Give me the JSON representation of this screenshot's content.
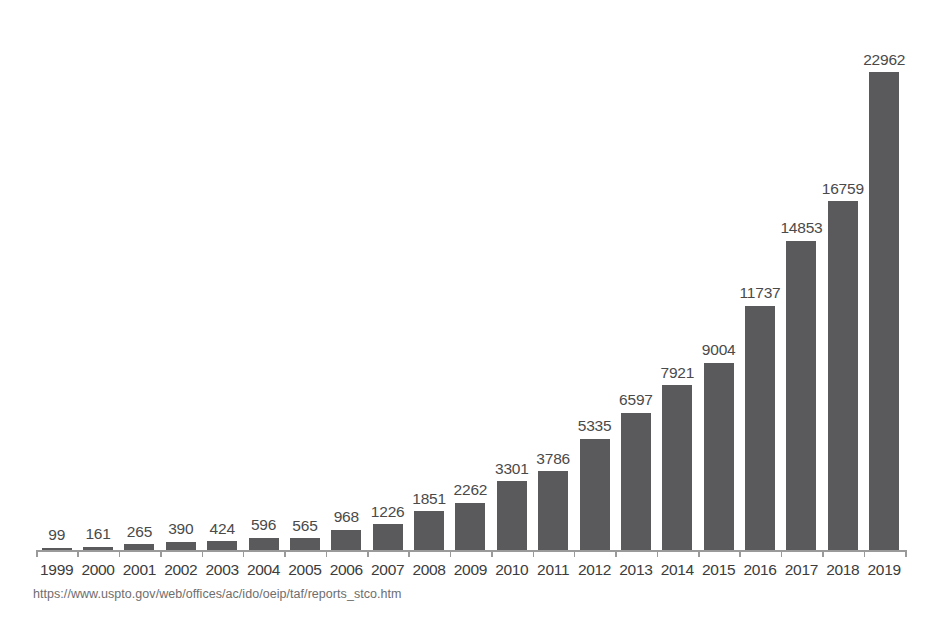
{
  "chart_data": {
    "type": "bar",
    "title": "",
    "subtitle": "",
    "xlabel": "",
    "ylabel": "",
    "grid": false,
    "legend": null,
    "ylim": [
      0,
      22962
    ],
    "axis_style": "baseline only, ticks between categories, no y-axis",
    "bar_color": "#5a5a5c",
    "categories": [
      "1999",
      "2000",
      "2001",
      "2002",
      "2003",
      "2004",
      "2005",
      "2006",
      "2007",
      "2008",
      "2009",
      "2010",
      "2011",
      "2012",
      "2013",
      "2014",
      "2015",
      "2016",
      "2017",
      "2018",
      "2019"
    ],
    "values": [
      99,
      161,
      265,
      390,
      424,
      596,
      565,
      968,
      1226,
      1851,
      2262,
      3301,
      3786,
      5335,
      6597,
      7921,
      9004,
      11737,
      14853,
      16759,
      22962
    ],
    "data_labels": [
      "99",
      "161",
      "265",
      "390",
      "424",
      "596",
      "565",
      "968",
      "1226",
      "1851",
      "2262",
      "3301",
      "3786",
      "5335",
      "6597",
      "7921",
      "9004",
      "11737",
      "14853",
      "16759",
      "22962"
    ]
  },
  "source": {
    "url_text": "https://www.uspto.gov/web/offices/ac/ido/oeip/taf/reports_stco.htm"
  },
  "colors": {
    "bar": "#5a5a5c",
    "axis": "#9a9a9a",
    "label": "#4a4a4a",
    "background": "#ffffff"
  }
}
